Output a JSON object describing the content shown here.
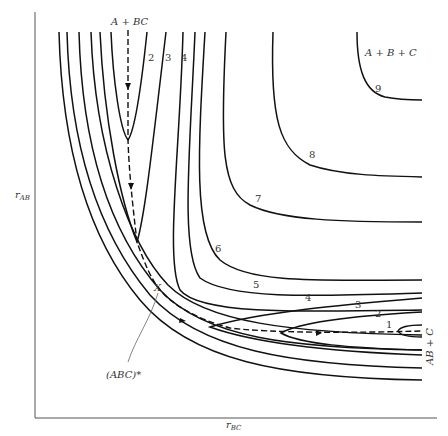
{
  "diagram": {
    "type": "potential energy contour map",
    "axes": {
      "y_label": "r",
      "y_label_sub": "AB",
      "x_label": "r",
      "x_label_sub": "BC"
    },
    "regions": {
      "reactants": "A + BC",
      "products": "AB + C",
      "dissociated": "A + B + C"
    },
    "saddle_point": {
      "marker": "X",
      "label": "(ABC)*"
    },
    "contour_labels": [
      "1",
      "2",
      "3",
      "4",
      "5",
      "6",
      "7",
      "8",
      "9"
    ],
    "contour_label_positions": {
      "top_2": "2",
      "top_3": "3",
      "top_4": "4",
      "right_1": "1",
      "right_2": "2",
      "right_3": "3",
      "right_4": "4",
      "right_5": "5",
      "mid_6": "6",
      "mid_7": "7",
      "mid_8": "8",
      "mid_9": "9"
    },
    "reaction_path": "dashed line with arrows from A + BC through saddle point to AB + C"
  }
}
